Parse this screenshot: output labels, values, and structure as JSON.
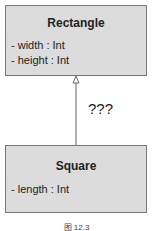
{
  "parent": {
    "name": "Rectangle",
    "attributes": [
      "- width : Int",
      "- height : Int"
    ]
  },
  "child": {
    "name": "Square",
    "attributes": [
      "- length : Int"
    ]
  },
  "relation_label": "???",
  "caption": "图 12.3"
}
